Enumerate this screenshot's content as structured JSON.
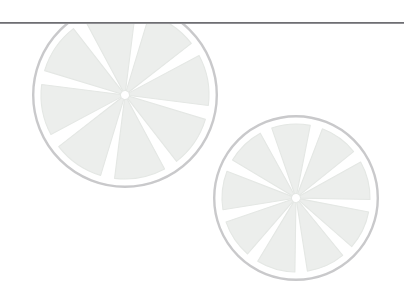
{
  "page": {
    "width": 404,
    "height": 299,
    "background_color": "#ffffff"
  },
  "divider": {
    "name": "horizontal-rule",
    "color": "#6e6e72",
    "thickness_px": 2,
    "y_px": 22,
    "x_start_px": 0,
    "x_end_px": 404
  },
  "illustration": {
    "subject": "citrus-fruit-slices",
    "style": "faded-watermark",
    "count": 2,
    "palette": {
      "rind_outline": "#c9c9cb",
      "flesh_fill": "#eceeec",
      "flesh_fill_edge": "#e4e7e4",
      "pith_divider": "#ffffff",
      "background": "#ffffff"
    },
    "slices": [
      {
        "name": "citrus-slice-large",
        "center_x": 125,
        "center_y": 95,
        "radius": 93,
        "segments": 8,
        "rotation_deg": 12,
        "clipped_top": true,
        "clip_y": 24
      },
      {
        "name": "citrus-slice-small",
        "center_x": 296,
        "center_y": 198,
        "radius": 83,
        "segments": 9,
        "rotation_deg": 6,
        "clipped_top": false,
        "clip_y": 0
      }
    ]
  }
}
